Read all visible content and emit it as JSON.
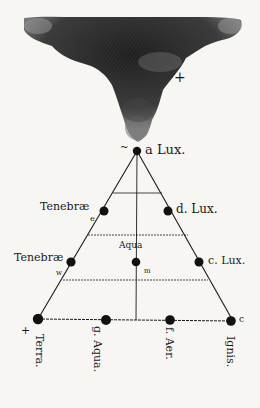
{
  "diagram": {
    "type": "triangle-of-elements",
    "cloud": {
      "mark": "+"
    },
    "nodes": [
      {
        "id": "apex",
        "letter": "a",
        "label": "Lux.",
        "mark": "~"
      },
      {
        "id": "left-upper",
        "label": "Tenebræ",
        "mark": "e"
      },
      {
        "id": "right-upper",
        "letter": "d.",
        "label": "Lux."
      },
      {
        "id": "center",
        "label": "Aqua"
      },
      {
        "id": "left-middle",
        "label": "Tenebræ",
        "mark": "w"
      },
      {
        "id": "right-middle",
        "letter": "c.",
        "label": "Lux."
      },
      {
        "id": "base-terra",
        "label": "Terra.",
        "mark": "+"
      },
      {
        "id": "base-aqua",
        "letter": "g.",
        "label": "Aqua."
      },
      {
        "id": "base-aer",
        "letter": "f.",
        "label": "Aer."
      },
      {
        "id": "base-ignis",
        "label": "Ignis.",
        "mark": "c"
      }
    ],
    "labels": {
      "apex": "a Lux.",
      "left_upper": "Tenebræ",
      "right_upper": "d. Lux.",
      "center": "Aqua",
      "left_middle": "Tenebræ",
      "right_middle": "c. Lux.",
      "terra": "Terra.",
      "g_aqua": "g. Aqua.",
      "f_aer": "f. Aer.",
      "ignis": "Ignis.",
      "cloud_mark": "+",
      "terra_mark": "+",
      "ignis_mark": "c",
      "apex_mark": "~",
      "left_upper_mark": "e",
      "left_middle_mark": "w",
      "center_mark": "m"
    },
    "colors": {
      "ink": "#1a1a1a",
      "paper": "#f7f6f3",
      "cloud": "#2b2b2b"
    }
  }
}
